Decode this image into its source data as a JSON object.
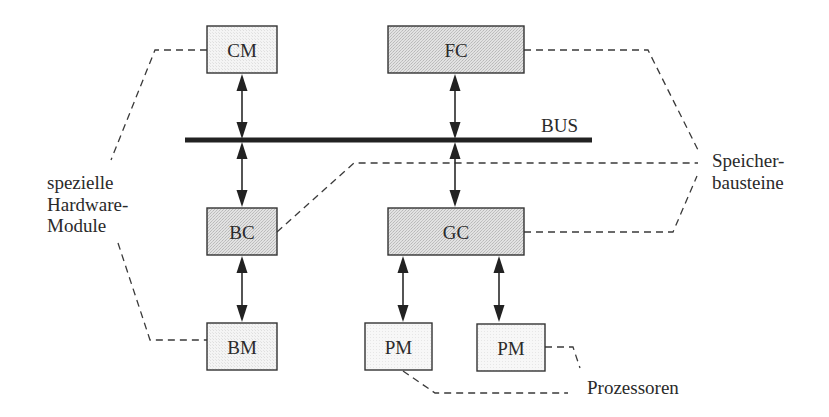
{
  "diagram": {
    "bus": {
      "label": "BUS",
      "x1": 185,
      "x2": 592,
      "y": 140
    },
    "colors": {
      "box_fill_light": "#f1f1f1",
      "box_fill_shaded": "#dcdcdc",
      "box_fill_pm": "#f4f4f4",
      "stroke": "#333333",
      "bus": "#222222"
    },
    "boxes": [
      {
        "id": "CM",
        "label": "CM",
        "x": 207,
        "y": 26,
        "w": 70,
        "h": 47,
        "shade": "light"
      },
      {
        "id": "FC",
        "label": "FC",
        "x": 388,
        "y": 26,
        "w": 136,
        "h": 47,
        "shade": "shaded"
      },
      {
        "id": "BC",
        "label": "BC",
        "x": 207,
        "y": 208,
        "w": 70,
        "h": 47,
        "shade": "shaded"
      },
      {
        "id": "GC",
        "label": "GC",
        "x": 388,
        "y": 208,
        "w": 136,
        "h": 47,
        "shade": "shaded"
      },
      {
        "id": "BM",
        "label": "BM",
        "x": 207,
        "y": 323,
        "w": 70,
        "h": 47,
        "shade": "light"
      },
      {
        "id": "PM1",
        "label": "PM",
        "x": 365,
        "y": 323,
        "w": 67,
        "h": 47,
        "shade": "pm"
      },
      {
        "id": "PM2",
        "label": "PM",
        "x": 477,
        "y": 324,
        "w": 68,
        "h": 47,
        "shade": "pm"
      }
    ],
    "arrows": [
      {
        "from": "CM",
        "to": "BUS",
        "x": 242,
        "y1": 74,
        "y2": 139
      },
      {
        "from": "FC",
        "to": "BUS",
        "x": 455,
        "y1": 74,
        "y2": 139
      },
      {
        "from": "BUS",
        "to": "BC",
        "x": 242,
        "y1": 142,
        "y2": 207
      },
      {
        "from": "BUS",
        "to": "GC",
        "x": 455,
        "y1": 142,
        "y2": 207
      },
      {
        "from": "BC",
        "to": "BM",
        "x": 242,
        "y1": 256,
        "y2": 322
      },
      {
        "from": "GC",
        "to": "PM1",
        "x": 403,
        "y1": 256,
        "y2": 322
      },
      {
        "from": "GC",
        "to": "PM2",
        "x": 499,
        "y1": 256,
        "y2": 322
      }
    ],
    "groups": [
      {
        "name": "spezielle-hardware-module",
        "label_lines": [
          "spezielle",
          "Hardware-",
          "Module"
        ],
        "label_x": 47,
        "label_y": [
          189,
          211,
          232
        ],
        "members": [
          "CM",
          "BC",
          "BM"
        ]
      },
      {
        "name": "speicherbausteine",
        "label_lines": [
          "Speicher-",
          "bausteine"
        ],
        "label_x": 712,
        "label_y": [
          167,
          189
        ],
        "members": [
          "FC",
          "BC",
          "GC"
        ]
      },
      {
        "name": "prozessoren",
        "label_lines": [
          "Prozessoren"
        ],
        "label_x": 587,
        "label_y": [
          394
        ],
        "members": [
          "PM1",
          "PM2"
        ]
      }
    ],
    "dashed_connectors": [
      {
        "group": "spezielle-hardware-module",
        "points": "207,50 155,50 111,160"
      },
      {
        "group": "spezielle-hardware-module",
        "points": "118,243 150,340 207,340"
      },
      {
        "group": "speicherbausteine",
        "points": "524,50 648,50 698,150"
      },
      {
        "group": "speicherbausteine",
        "points": "277,232 354,163 698,163"
      },
      {
        "group": "speicherbausteine",
        "points": "524,232 673,232 697,176"
      },
      {
        "group": "prozessoren",
        "points": "403,371 435,393 568,393"
      },
      {
        "group": "prozessoren",
        "points": "545,347 573,347 580,368"
      }
    ]
  }
}
